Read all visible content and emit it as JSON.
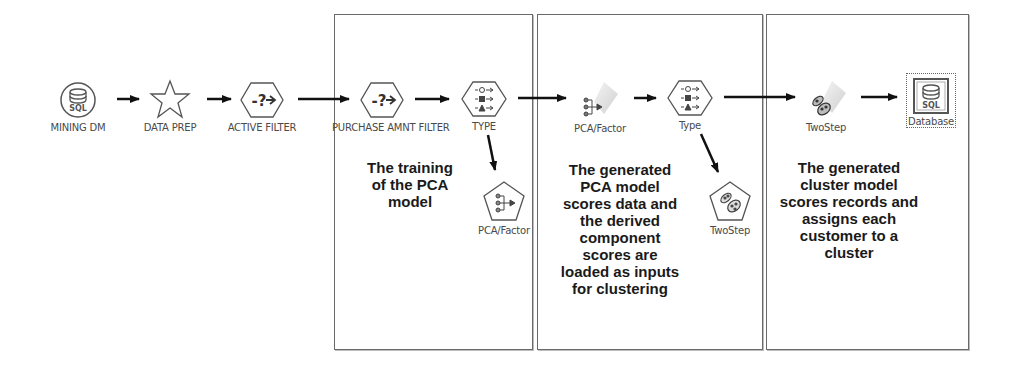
{
  "diagram": {
    "type": "stream-flow",
    "nodes": [
      {
        "id": "mining_dm",
        "label": "MINING DM",
        "icon": "sql-database-circle-icon"
      },
      {
        "id": "data_prep",
        "label": "DATA PREP",
        "icon": "star-supernode-icon"
      },
      {
        "id": "active_filter",
        "label": "ACTIVE FILTER",
        "icon": "select-hexagon-icon"
      },
      {
        "id": "purchase_amnt_filter",
        "label": "PURCHASE AMNT FILTER",
        "icon": "select-hexagon-icon"
      },
      {
        "id": "type_upper",
        "label": "TYPE",
        "icon": "type-hexagon-icon"
      },
      {
        "id": "pca_factor_model_builder",
        "label": "PCA/Factor",
        "icon": "pca-pentagon-icon"
      },
      {
        "id": "pca_factor_nugget",
        "label": "PCA/Factor",
        "icon": "pca-nugget-icon"
      },
      {
        "id": "type_lower",
        "label": "Type",
        "icon": "type-hexagon-icon"
      },
      {
        "id": "twostep_builder",
        "label": "TwoStep",
        "icon": "twostep-pentagon-icon"
      },
      {
        "id": "twostep_nugget",
        "label": "TwoStep",
        "icon": "twostep-nugget-icon"
      },
      {
        "id": "database_export",
        "label": "Database",
        "icon": "sql-database-square-icon"
      }
    ],
    "edges": [
      [
        "mining_dm",
        "data_prep"
      ],
      [
        "data_prep",
        "active_filter"
      ],
      [
        "active_filter",
        "purchase_amnt_filter"
      ],
      [
        "purchase_amnt_filter",
        "type_upper"
      ],
      [
        "type_upper",
        "pca_factor_model_builder"
      ],
      [
        "type_upper",
        "pca_factor_nugget"
      ],
      [
        "pca_factor_nugget",
        "type_lower"
      ],
      [
        "type_lower",
        "twostep_builder"
      ],
      [
        "type_lower",
        "twostep_nugget"
      ],
      [
        "twostep_nugget",
        "database_export"
      ]
    ],
    "annotations": [
      {
        "id": "box_training",
        "text": "The training\nof the PCA\nmodel"
      },
      {
        "id": "box_scoring",
        "text": "The generated\nPCA model\nscores data and\nthe derived\ncomponent\nscores are\nloaded as inputs\nfor clustering"
      },
      {
        "id": "box_cluster",
        "text": "The generated\ncluster model\nscores records and\nassigns each\ncustomer to a\ncluster"
      }
    ]
  },
  "labels": {
    "mining_dm": "MINING DM",
    "data_prep": "DATA PREP",
    "active_filter": "ACTIVE FILTER",
    "purchase_amnt_filter": "PURCHASE AMNT FILTER",
    "type_upper": "TYPE",
    "pca_builder": "PCA/Factor",
    "pca_nugget": "PCA/Factor",
    "type_lower": "Type",
    "twostep_builder": "TwoStep",
    "twostep_nugget": "TwoStep",
    "database": "Database"
  },
  "notes": {
    "training": [
      "The training",
      "of the PCA",
      "model"
    ],
    "scoring": [
      "The generated",
      "PCA model",
      "scores data and",
      "the derived",
      "component",
      "scores are",
      "loaded as inputs",
      "for clustering"
    ],
    "cluster": [
      "The generated",
      "cluster model",
      "scores records and",
      "assigns each",
      "customer to a",
      "cluster"
    ]
  },
  "colors": {
    "box_border": "#6a6a6a",
    "arrow": "#111111",
    "icon_stroke": "#555555",
    "label_text": "#4a4a4a",
    "note_text": "#1a1a1a"
  }
}
